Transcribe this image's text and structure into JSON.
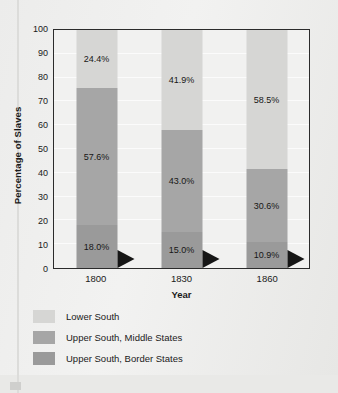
{
  "chart_data": {
    "type": "bar",
    "subtype": "stacked-bar-100-percent",
    "title": "",
    "xlabel": "Year",
    "ylabel": "Percentage of Slaves",
    "categories": [
      "1800",
      "1830",
      "1860"
    ],
    "ylim": [
      0,
      100
    ],
    "yticks": [
      0,
      10,
      20,
      30,
      40,
      50,
      60,
      70,
      80,
      90,
      100
    ],
    "grid": true,
    "legend_position": "bottom-left",
    "series": [
      {
        "name": "Upper South, Border States",
        "color": "#9a9a9a",
        "values": [
          18.0,
          15.0,
          10.9
        ],
        "labels": [
          "18.0%",
          "15.0%",
          "10.9%"
        ]
      },
      {
        "name": "Upper South, Middle States",
        "color": "#a6a6a6",
        "values": [
          57.6,
          43.0,
          30.6
        ],
        "labels": [
          "57.6%",
          "43.0%",
          "30.6%"
        ]
      },
      {
        "name": "Lower South",
        "color": "#d6d6d4",
        "values": [
          24.4,
          41.9,
          58.5
        ],
        "labels": [
          "24.4%",
          "41.9%",
          "58.5%"
        ]
      }
    ]
  },
  "axis": {
    "y_title": "Percentage of Slaves",
    "x_title": "Year",
    "y_ticks": [
      "100",
      "90",
      "80",
      "70",
      "60",
      "50",
      "40",
      "30",
      "20",
      "10",
      "0"
    ],
    "x_ticks": [
      "1800",
      "1830",
      "1860"
    ]
  },
  "bars": [
    {
      "category": "1800",
      "segments": [
        {
          "label": "24.4%",
          "value": 24.4,
          "series": "Lower South"
        },
        {
          "label": "57.6%",
          "value": 57.6,
          "series": "Upper South, Middle States"
        },
        {
          "label": "18.0%",
          "value": 18.0,
          "series": "Upper South, Border States"
        }
      ]
    },
    {
      "category": "1830",
      "segments": [
        {
          "label": "41.9%",
          "value": 41.9,
          "series": "Lower South"
        },
        {
          "label": "43.0%",
          "value": 43.0,
          "series": "Upper South, Middle States"
        },
        {
          "label": "15.0%",
          "value": 15.0,
          "series": "Upper South, Border States"
        }
      ]
    },
    {
      "category": "1860",
      "segments": [
        {
          "label": "58.5%",
          "value": 58.5,
          "series": "Lower South"
        },
        {
          "label": "30.6%",
          "value": 30.6,
          "series": "Upper South, Middle States"
        },
        {
          "label": "10.9%",
          "value": 10.9,
          "series": "Upper South, Border States"
        }
      ]
    }
  ],
  "legend": {
    "items": [
      {
        "label": "Lower South",
        "color": "#d6d6d4"
      },
      {
        "label": "Upper South, Middle States",
        "color": "#a6a6a6"
      },
      {
        "label": "Upper South, Border States",
        "color": "#9a9a9a"
      }
    ]
  },
  "colors": {
    "lower_south": "#d6d6d4",
    "upper_south_middle": "#a6a6a6",
    "upper_south_border": "#9a9a9a",
    "plot_background": "#f1f1f0",
    "page_background": "#ececeb",
    "axis_line": "#2b2b2b",
    "text": "#1a1a1a",
    "arrow": "#161616"
  }
}
